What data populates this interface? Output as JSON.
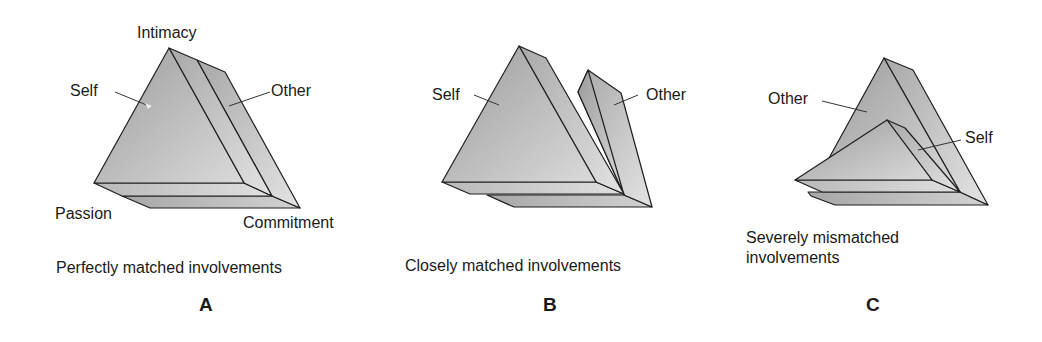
{
  "panels": [
    {
      "id": "A",
      "letter": "A",
      "caption": "Perfectly matched involvements",
      "labels": {
        "top": "Intimacy",
        "left_bottom": "Passion",
        "right_bottom": "Commitment",
        "self": "Self",
        "other": "Other"
      }
    },
    {
      "id": "B",
      "letter": "B",
      "caption": "Closely matched involvements",
      "labels": {
        "self": "Self",
        "other": "Other"
      }
    },
    {
      "id": "C",
      "letter": "C",
      "caption_line1": "Severely mismatched",
      "caption_line2": "involvements",
      "labels": {
        "self": "Self",
        "other": "Other"
      }
    }
  ],
  "colors": {
    "front_face_light": "#d6d6d6",
    "front_face_dark": "#9a9a9a",
    "side_face": "#c4c4c4",
    "stroke": "#1e1e1e"
  }
}
